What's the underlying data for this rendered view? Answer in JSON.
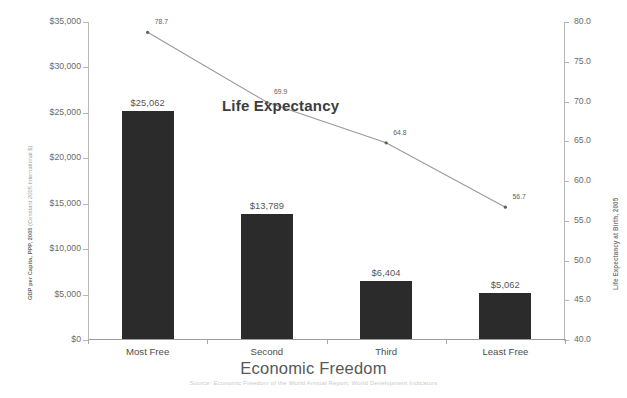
{
  "chart_data": {
    "type": "bar",
    "title": "",
    "subtitle": "",
    "xlabel": "Economic Freedom",
    "categories": [
      "Most Free",
      "Second",
      "Third",
      "Least Free"
    ],
    "series": [
      {
        "name": "GDP per Capita",
        "type": "bar",
        "axis": "left",
        "values": [
          25062,
          13789,
          6404,
          5062
        ],
        "value_labels": [
          "$25,062",
          "$13,789",
          "$6,404",
          "$5,062"
        ],
        "color": "#2b2b2b"
      },
      {
        "name": "Life Expectancy",
        "type": "line",
        "axis": "right",
        "values": [
          78.7,
          69.9,
          64.8,
          56.7
        ],
        "value_labels": [
          "78.7",
          "69.9",
          "64.8",
          "56.7"
        ],
        "color": "#9a9a9a"
      }
    ],
    "y_left": {
      "label": "GDP per Capita, PPP, 2005 (Constant 2005 International $)",
      "label_strong": "GDP per Capita, PPP, 2005",
      "label_light": " (Constant 2005 International $)",
      "ticks": [
        "$0",
        "$5,000",
        "$10,000",
        "$15,000",
        "$20,000",
        "$25,000",
        "$30,000",
        "$35,000"
      ],
      "tick_values": [
        0,
        5000,
        10000,
        15000,
        20000,
        25000,
        30000,
        35000
      ],
      "ylim": [
        0,
        35000
      ]
    },
    "y_right": {
      "label": "Life Expectancy at Birth, 2005",
      "ticks": [
        "40.0",
        "45.0",
        "50.0",
        "55.0",
        "60.0",
        "65.0",
        "70.0",
        "75.0",
        "80.0"
      ],
      "tick_values": [
        40,
        45,
        50,
        55,
        60,
        65,
        70,
        75,
        80
      ],
      "ylim": [
        40,
        80
      ]
    },
    "annotations": [
      {
        "text": "Life Expectancy",
        "target": "line-series"
      }
    ],
    "grid": false,
    "legend_position": "none"
  },
  "caption": "Source: Economic Freedom of the World Annual Report; World Development Indicators"
}
